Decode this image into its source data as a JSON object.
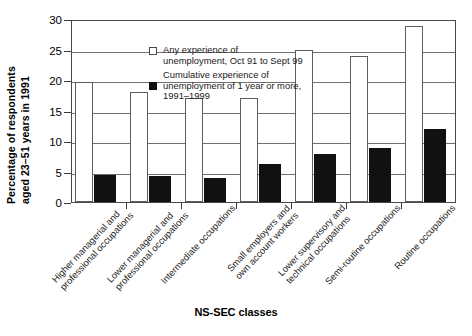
{
  "chart_data": {
    "type": "bar",
    "title": "",
    "xlabel": "NS-SEC classes",
    "ylabel_line1": "Percentage of respondents",
    "ylabel_line2": "aged 23–51 years in 1991",
    "ylim": [
      0,
      30
    ],
    "yticks": [
      0,
      5,
      10,
      15,
      20,
      25,
      30
    ],
    "ytick_labels": [
      "0",
      "5",
      "10",
      "15",
      "20",
      "25",
      "30"
    ],
    "grid": true,
    "legend_position": "top-left inside plot",
    "categories": [
      [
        "Higher managerial and",
        "professional occupations"
      ],
      [
        "Lower managerial and",
        "professional occupations"
      ],
      [
        "Intermediate occupations"
      ],
      [
        "Small employers and",
        "own account workers"
      ],
      [
        "Lower supervisory and",
        "technical occupations"
      ],
      [
        "Semi-routine occupations"
      ],
      [
        "Routine occupations"
      ]
    ],
    "series": [
      {
        "name": "Any experience of unemployment, Oct 91 to Sept 99",
        "color": "#ffffff",
        "values": [
          19.6,
          18.0,
          17.0,
          17.0,
          25.0,
          24.0,
          28.8
        ]
      },
      {
        "name": "Cumulative experience of unemployment of 1 year or more, 1991–1999",
        "color": "#111111",
        "values": [
          4.5,
          4.2,
          3.9,
          6.2,
          7.8,
          8.9,
          12.0
        ]
      }
    ]
  },
  "legend": {
    "entry1_line1": "Any experience of",
    "entry1_line2": "unemployment, Oct 91 to Sept 99",
    "entry2_line1": "Cumulative experience of",
    "entry2_line2": "unemployment of 1 year or more,",
    "entry2_line3": "1991–1999"
  }
}
